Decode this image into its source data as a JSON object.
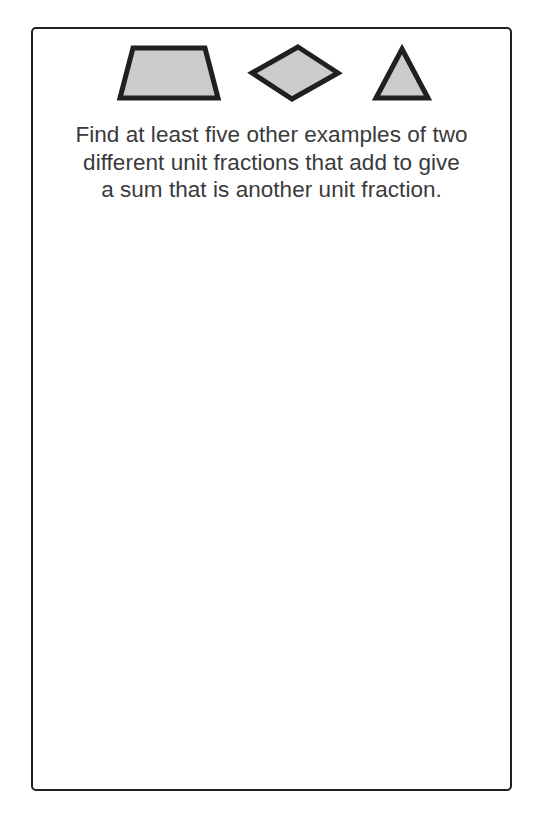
{
  "page": {
    "background_color": "#ffffff",
    "width": 545,
    "height": 821
  },
  "task_card": {
    "border_color": "#231f20",
    "background_color": "#ffffff"
  },
  "shapes": {
    "fill_color": "#cccccc",
    "outline_color": "#231f20",
    "items": [
      {
        "name": "trapezium",
        "label": "trapezium"
      },
      {
        "name": "rhombus",
        "label": "rhombus"
      },
      {
        "name": "triangle",
        "label": "triangle"
      }
    ]
  },
  "instruction": {
    "text_color": "#3a3a3c",
    "full_text": "Find at least five other examples of two different unit fractions that add to give a sum that is another unit fraction.",
    "lines": [
      "Find at least five other examples of two",
      "different unit fractions that add to give",
      "a sum that is another unit fraction."
    ]
  },
  "workspace": {
    "content": ""
  }
}
